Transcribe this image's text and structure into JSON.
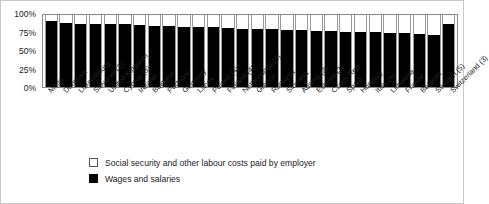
{
  "chart_data": {
    "type": "bar",
    "title": "",
    "subtitle": "",
    "xlabel": "",
    "ylabel": "",
    "ylim": [
      0,
      100
    ],
    "ytick_labels": [
      "100%",
      "75%",
      "50%",
      "25%",
      "0%"
    ],
    "ytick_values": [
      100,
      75,
      50,
      25,
      0
    ],
    "grid": false,
    "stacked": true,
    "stack_total": 100,
    "legend_position": "bottom",
    "categories": [
      "Malta",
      "Denmark",
      "Luxembourg",
      "Slovenia (2)",
      "United Kingdom",
      "Cyprus (3)",
      "Ireland",
      "Bulgaria",
      "Portugal",
      "Germany",
      "Latvia",
      "Poland (4)",
      "Finland (4)",
      "Netherlands (4)",
      "Greece",
      "Romania",
      "Slovakia",
      "Austria (2)",
      "Estonia (3)",
      "Czech Rep.",
      "Spain",
      "Hungary",
      "Italy (4)",
      "Lithuania",
      "France",
      "Belgium",
      "Sweden (5)",
      "Switzerland (3)"
    ],
    "series": [
      {
        "name": "Wages and salaries",
        "color": "#000000",
        "values": [
          92,
          89,
          87,
          87,
          87,
          87,
          86,
          85,
          85,
          84,
          84,
          83,
          82,
          81,
          80,
          80,
          79,
          79,
          78,
          78,
          77,
          77,
          76,
          75,
          75,
          74,
          72,
          88
        ]
      },
      {
        "name": "Social security and other labour costs paid by employer",
        "color": "#ffffff",
        "values": [
          8,
          11,
          13,
          13,
          13,
          13,
          14,
          15,
          15,
          16,
          16,
          17,
          18,
          19,
          20,
          20,
          21,
          21,
          22,
          22,
          23,
          23,
          24,
          25,
          25,
          26,
          28,
          12
        ]
      }
    ],
    "legend": [
      {
        "label": "Social security and other labour costs paid by employer",
        "swatch": "open"
      },
      {
        "label": "Wages and salaries",
        "swatch": "filled"
      }
    ]
  }
}
